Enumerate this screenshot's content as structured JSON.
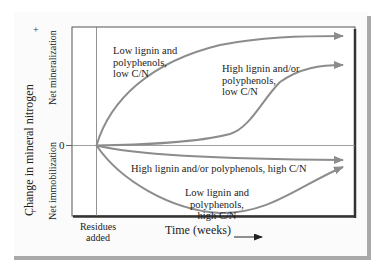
{
  "figure": {
    "y_axis": {
      "title": "Change in mineral nitrogen",
      "positive_label": "Net mineralization",
      "negative_label": "Net immobilization",
      "plus_sign": "+",
      "minus_sign": "–",
      "zero_tick": "0"
    },
    "x_axis": {
      "title": "Time (weeks)",
      "arrow": "→",
      "residues_marker_line1": "Residues",
      "residues_marker_line2": "added"
    },
    "curves": [
      {
        "id": "low-lignin-low-cn",
        "label_lines": [
          "Low lignin and",
          "polyphenols,",
          "low C/N"
        ],
        "trend": "rapid net mineralization",
        "color": "#8c8c8c"
      },
      {
        "id": "high-lignin-low-cn",
        "label_lines": [
          "High lignin and/or",
          "polyphenols,",
          "low C/N"
        ],
        "trend": "delayed net mineralization",
        "color": "#8c8c8c"
      },
      {
        "id": "high-lignin-high-cn",
        "label_lines": [
          "High lignin and/or polyphenols, high C/N"
        ],
        "trend": "slight, prolonged net immobilization",
        "color": "#8c8c8c"
      },
      {
        "id": "low-lignin-high-cn",
        "label_lines": [
          "Low lignin and polyphenols,",
          "high C/N"
        ],
        "trend": "strong immobilization then recovery",
        "color": "#8c8c8c"
      }
    ],
    "colors": {
      "curve": "#8c8c8c",
      "axis": "#555555",
      "frame_shadow": "#a9a9a9",
      "text": "#222222"
    }
  }
}
